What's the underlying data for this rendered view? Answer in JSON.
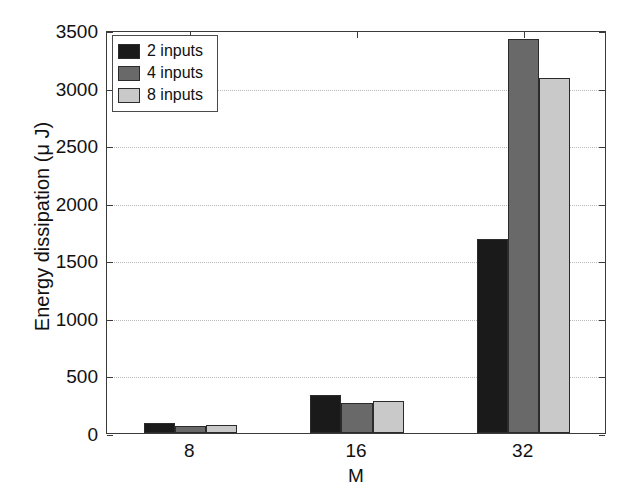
{
  "chart_data": {
    "type": "bar",
    "title": "",
    "xlabel": "M",
    "ylabel": "Energy dissipation (μ J)",
    "categories": [
      "8",
      "16",
      "32"
    ],
    "series": [
      {
        "name": "2 inputs",
        "color": "#1a1a1a",
        "values": [
          85,
          330,
          1685
        ]
      },
      {
        "name": "4 inputs",
        "color": "#696969",
        "values": [
          60,
          260,
          3420
        ]
      },
      {
        "name": "8 inputs",
        "color": "#c9c9c9",
        "values": [
          68,
          278,
          3080
        ]
      }
    ],
    "ylim": [
      0,
      3500
    ],
    "yticks": [
      0,
      500,
      1000,
      1500,
      2000,
      2500,
      3000,
      3500
    ],
    "ytick_labels": [
      "0",
      "500",
      "1000",
      "1500",
      "2000",
      "2500",
      "3000",
      "3500"
    ],
    "grid": true,
    "grid_axis": "y",
    "legend_position": "upper left",
    "bar_edge_color": "#2b2b2b",
    "axis_color": "#3a3a3a",
    "gridline_color": "#b9b9b9",
    "background": "#ffffff"
  },
  "legend": {
    "items": [
      {
        "label": "2 inputs",
        "color": "#1a1a1a"
      },
      {
        "label": "4 inputs",
        "color": "#696969"
      },
      {
        "label": "8 inputs",
        "color": "#c9c9c9"
      }
    ]
  }
}
